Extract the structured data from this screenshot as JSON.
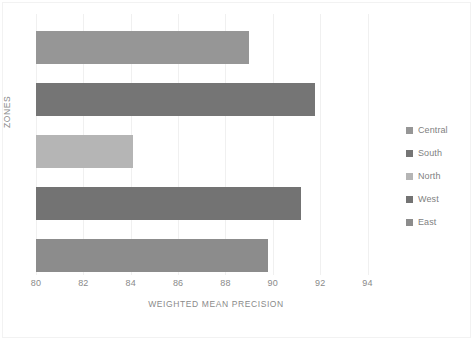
{
  "chart_data": {
    "type": "bar",
    "orientation": "horizontal",
    "title": "",
    "xlabel": "WEIGHTED MEAN PRECISION",
    "ylabel": "ZONES",
    "xlim": [
      80,
      95.2
    ],
    "xticks": [
      80,
      82,
      84,
      86,
      88,
      90,
      92,
      94
    ],
    "xtick_labels": [
      "80",
      "82",
      "84",
      "86",
      "88",
      "90",
      "92",
      "94"
    ],
    "grid": true,
    "grid_axis": "x",
    "legend_position": "right",
    "categories": [
      "Central",
      "South",
      "North",
      "West",
      "East"
    ],
    "values": [
      89.0,
      91.8,
      84.1,
      91.2,
      89.8
    ],
    "series": [
      {
        "name": "Weighted Mean Precision",
        "values": [
          89.0,
          91.8,
          84.1,
          91.2,
          89.8
        ]
      }
    ],
    "bars": [
      {
        "label": "Central",
        "value": 89.0,
        "color": "#969696"
      },
      {
        "label": "South",
        "value": 91.8,
        "color": "#757575"
      },
      {
        "label": "North",
        "value": 84.1,
        "color": "#b5b5b5"
      },
      {
        "label": "West",
        "value": 91.2,
        "color": "#737373"
      },
      {
        "label": "East",
        "value": 89.8,
        "color": "#8c8c8c"
      }
    ]
  },
  "legend": {
    "items": [
      {
        "label": "Central",
        "color": "#969696"
      },
      {
        "label": "South",
        "color": "#757575"
      },
      {
        "label": "North",
        "color": "#b5b5b5"
      },
      {
        "label": "West",
        "color": "#737373"
      },
      {
        "label": "East",
        "color": "#8c8c8c"
      }
    ]
  },
  "colors": {
    "background": "#ffffff",
    "gridline": "#f0f0f0",
    "axis_text": "#8a8a8a",
    "legend_text": "#7f7f7f",
    "frame": "#f2f2f2"
  }
}
